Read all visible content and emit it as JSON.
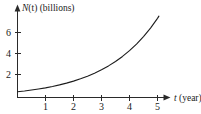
{
  "chart_data": {
    "type": "line",
    "title": "",
    "subtitle": "",
    "xlabel": "t (year)",
    "xlabel_variable": "t",
    "xlabel_unit": "(year)",
    "ylabel": "N(t) (billions)",
    "ylabel_variable": "N",
    "ylabel_variable_arg": "(t)",
    "ylabel_unit": "(billions)",
    "xlim": [
      0,
      5.4
    ],
    "ylim": [
      0,
      8.6
    ],
    "xticks": [
      1,
      2,
      3,
      4,
      5
    ],
    "xtick_labels": [
      "1",
      "2",
      "3",
      "4",
      "5"
    ],
    "yticks": [
      2,
      4,
      6
    ],
    "ytick_labels": [
      "2",
      "4",
      "6"
    ],
    "grid": false,
    "legend": null,
    "annotations": [],
    "series": [
      {
        "name": "N(t)",
        "x": [
          0.0,
          0.25,
          0.5,
          0.75,
          1.0,
          1.25,
          1.5,
          1.75,
          2.0,
          2.25,
          2.5,
          2.75,
          3.0,
          3.25,
          3.5,
          3.75,
          4.0,
          4.25,
          4.5,
          4.75,
          5.0,
          5.05
        ],
        "y": [
          0.55,
          0.62,
          0.71,
          0.81,
          0.92,
          1.05,
          1.2,
          1.37,
          1.56,
          1.78,
          2.03,
          2.32,
          2.64,
          3.01,
          3.43,
          3.91,
          4.46,
          5.09,
          5.8,
          6.61,
          7.54,
          7.75
        ]
      }
    ],
    "axis_color": "#2a2a2a",
    "curve_color": "#1c1c1c",
    "background_color": "#ffffff"
  }
}
